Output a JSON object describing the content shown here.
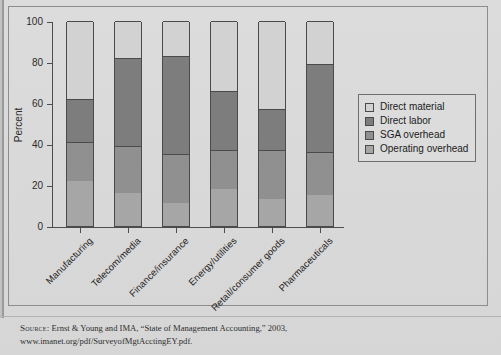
{
  "figure": {
    "axis_y_label": "Percent",
    "y_ticks": [
      "0",
      "20",
      "40",
      "60",
      "80",
      "100"
    ],
    "legend": {
      "items": [
        {
          "label": "Direct material",
          "color": "#d2d2d2"
        },
        {
          "label": "Direct labor",
          "color": "#7d7d7d"
        },
        {
          "label": "SGA overhead",
          "color": "#909090"
        },
        {
          "label": "Operating overhead",
          "color": "#a6a6a6"
        }
      ]
    },
    "source": {
      "prefix": "Source:",
      "line1": "  Ernst & Young and IMA, “State of Management Accounting,” 2003,",
      "line2": "www.imanet.org/pdf/SurveyofMgtAcctingEY.pdf."
    }
  },
  "chart_data": {
    "type": "bar",
    "subtype": "stacked",
    "title": "",
    "xlabel": "",
    "ylabel": "Percent",
    "ylim": [
      0,
      100
    ],
    "yticks": [
      0,
      20,
      40,
      60,
      80,
      100
    ],
    "grid": false,
    "legend_position": "right",
    "categories": [
      "Manufacturing",
      "Telecom/media",
      "Finance/insurance",
      "Energy/utilities",
      "Retail/consumer goods",
      "Pharmaceuticals"
    ],
    "stack_order_bottom_to_top": [
      "Operating overhead",
      "SGA overhead",
      "Direct labor",
      "Direct material"
    ],
    "series": [
      {
        "name": "Operating overhead",
        "color": "#a6a6a6",
        "values": [
          22,
          16,
          11,
          18,
          13,
          15
        ]
      },
      {
        "name": "SGA overhead",
        "color": "#909090",
        "values": [
          19,
          23,
          24,
          19,
          24,
          21
        ]
      },
      {
        "name": "Direct labor",
        "color": "#7d7d7d",
        "values": [
          21,
          43,
          48,
          29,
          20,
          43
        ]
      },
      {
        "name": "Direct material",
        "color": "#d2d2d2",
        "values": [
          38,
          18,
          17,
          34,
          43,
          21
        ]
      }
    ],
    "cumulative_tops": [
      [
        22,
        41,
        62,
        100
      ],
      [
        16,
        39,
        82,
        100
      ],
      [
        11,
        35,
        83,
        100
      ],
      [
        18,
        37,
        66,
        100
      ],
      [
        13,
        37,
        57,
        100
      ],
      [
        15,
        36,
        79,
        100
      ]
    ]
  }
}
